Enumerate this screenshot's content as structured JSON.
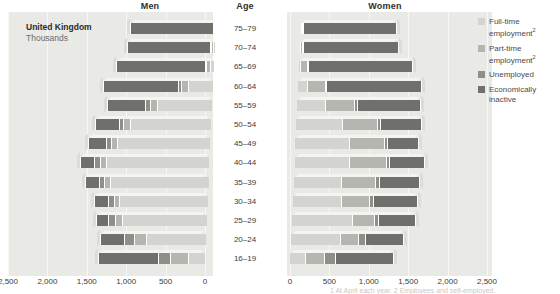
{
  "headers": {
    "men": "Men",
    "age": "Age",
    "women": "Women"
  },
  "caption": {
    "region": "United Kingdom",
    "units": "Thousands"
  },
  "legend": {
    "items": [
      {
        "label": "Full-time employment",
        "sup": "2",
        "color": "#d3d3cf",
        "key": "full_time"
      },
      {
        "label": "Part-time employment",
        "sup": "2",
        "color": "#b6b6b1",
        "key": "part_time"
      },
      {
        "label": "Unemployed",
        "sup": "",
        "color": "#8f8f8a",
        "key": "unemployed"
      },
      {
        "label": "Economically inactive",
        "sup": "",
        "color": "#6f6f6b",
        "key": "inactive"
      }
    ]
  },
  "axis": {
    "men_ticks": [
      "2,500",
      "2,000",
      "1,500",
      "1,000",
      "500",
      "0"
    ],
    "women_ticks": [
      "0",
      "500",
      "1,000",
      "1,500",
      "2,000",
      "2,500"
    ],
    "max": 2500,
    "tick_step": 500
  },
  "chart_data": {
    "type": "bar",
    "subtitle": "Thousands",
    "xlabel": "Thousands",
    "ylabel": "Age",
    "orientation": "horizontal",
    "layout": "population-pyramid",
    "stacked": true,
    "grid": true,
    "legend_position": "right",
    "xlim": [
      0,
      2500
    ],
    "categories": [
      "75-79",
      "70-74",
      "65-69",
      "60-64",
      "55-59",
      "50-54",
      "45-49",
      "40-44",
      "35-39",
      "30-34",
      "25-29",
      "20-24",
      "16-19"
    ],
    "series_names": [
      "Full-time employment",
      "Part-time employment",
      "Unemployed",
      "Economically inactive"
    ],
    "men": {
      "full_time": [
        10,
        20,
        45,
        320,
        700,
        1030,
        1180,
        1310,
        1250,
        1120,
        1080,
        760,
        210
      ],
      "part_time": [
        15,
        25,
        60,
        90,
        95,
        85,
        80,
        80,
        75,
        75,
        85,
        150,
        230
      ],
      "unemployed": [
        5,
        8,
        15,
        40,
        55,
        60,
        65,
        70,
        70,
        75,
        85,
        130,
        155
      ],
      "inactive": [
        1060,
        1060,
        1130,
        950,
        490,
        300,
        225,
        185,
        170,
        170,
        160,
        300,
        760
      ]
    },
    "women": {
      "full_time": [
        5,
        10,
        25,
        120,
        360,
        590,
        690,
        700,
        620,
        620,
        780,
        640,
        200
      ],
      "part_time": [
        20,
        30,
        85,
        230,
        380,
        450,
        450,
        470,
        430,
        360,
        270,
        220,
        250
      ],
      "unemployed": [
        3,
        5,
        10,
        20,
        30,
        35,
        40,
        45,
        45,
        50,
        55,
        90,
        130
      ],
      "inactive": [
        1190,
        1210,
        1330,
        1200,
        800,
        520,
        390,
        440,
        510,
        560,
        470,
        490,
        740
      ]
    }
  },
  "footnote": "1 At April each year.  2 Employees and self-employed."
}
